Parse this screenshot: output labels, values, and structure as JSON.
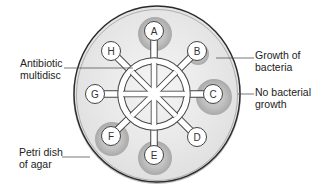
{
  "diagram": {
    "type": "antibiotic multidisc sensitivity test on petri dish",
    "labels": {
      "antibiotic_multidisc": [
        "Antibiotic",
        "multidisc"
      ],
      "growth_of_bacteria": [
        "Growth of",
        "bacteria"
      ],
      "no_bacterial_growth": [
        "No bacterial",
        "growth"
      ],
      "petri_dish": [
        "Petri dish",
        "of agar"
      ]
    },
    "discs": [
      {
        "letter": "A",
        "x": 154,
        "y": 31,
        "zone": 17
      },
      {
        "letter": "B",
        "x": 197,
        "y": 51,
        "zone": 11
      },
      {
        "letter": "C",
        "x": 213,
        "y": 94,
        "zone": 18
      },
      {
        "letter": "D",
        "x": 197,
        "y": 137,
        "zone": 0
      },
      {
        "letter": "E",
        "x": 154,
        "y": 155,
        "zone": 17
      },
      {
        "letter": "F",
        "x": 111,
        "y": 136,
        "zone": 17
      },
      {
        "letter": "G",
        "x": 95,
        "y": 94,
        "zone": 0
      },
      {
        "letter": "H",
        "x": 111,
        "y": 51,
        "zone": 0
      }
    ],
    "colors": {
      "dish_fill": "#ececec",
      "dish_rim": "#333333",
      "zone": "#b5b5b5",
      "disc_fill": "#ffffff",
      "line": "#555555"
    }
  }
}
